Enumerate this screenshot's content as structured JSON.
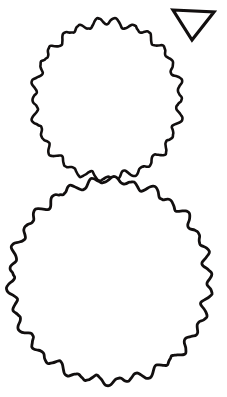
{
  "artwork": {
    "title": "Snowman Outline Line Art",
    "style": "coloring-book line drawing",
    "background_color": "#ffffff",
    "ink_color": "#120f0f",
    "canvas": {
      "width": 227,
      "height": 397
    },
    "shapes": [
      {
        "id": "head-snowball",
        "name": "upper-wavy-circle",
        "description": "Upper bumpy-edged snowball (head)",
        "center": {
          "x": 107,
          "y": 100
        },
        "radius_x": 73,
        "radius_y": 78,
        "bumps": 26,
        "bump_amplitude": 3.2,
        "stroke_width": 2.6,
        "fill": "#ffffff",
        "stroke": "#120f0f",
        "bounds": {
          "left": 34,
          "top": 22,
          "right": 181,
          "bottom": 178
        }
      },
      {
        "id": "body-snowball",
        "name": "lower-wavy-circle",
        "description": "Lower bumpy-edged snowball (body)",
        "center": {
          "x": 110,
          "y": 281
        },
        "radius_x": 99,
        "radius_y": 100,
        "bumps": 30,
        "bump_amplitude": 3.6,
        "stroke_width": 2.8,
        "fill": "#ffffff",
        "stroke": "#120f0f",
        "bounds": {
          "left": 11,
          "top": 181,
          "right": 209,
          "bottom": 380
        }
      },
      {
        "id": "down-triangle",
        "name": "downward-triangle",
        "description": "Small downward-pointing outlined triangle at top right",
        "points": "173,10 214,12 192,40",
        "stroke_width": 3.2,
        "fill": "#ffffff",
        "stroke": "#120f0f",
        "bounds": {
          "left": 171,
          "top": 8,
          "right": 216,
          "bottom": 42
        }
      }
    ]
  }
}
